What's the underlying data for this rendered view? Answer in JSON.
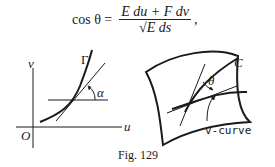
{
  "equation": {
    "lhs": "cos θ =",
    "numerator": "E du + F dv",
    "denominator": "√E ds",
    "trailing": ","
  },
  "left_diagram": {
    "curve_label": "Γ",
    "angle_label": "α",
    "x_axis_label": "u",
    "y_axis_label": "v",
    "origin_label": "O"
  },
  "right_diagram": {
    "curve_label": "C",
    "angle_label": "θ",
    "pointer_label": "v-curve"
  },
  "caption": "Fig. 129"
}
